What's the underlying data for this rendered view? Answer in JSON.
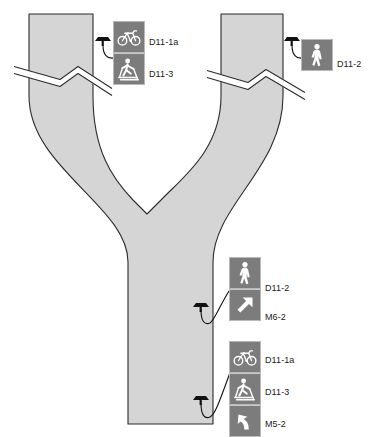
{
  "diagram": {
    "path_fill": "#d5d5d5",
    "path_stroke": "#2b2b2b",
    "sign_panel_color": "#7c7c7c",
    "sign_glyph_color": "#ffffff",
    "sign_border_color": "#b9b9b9",
    "label_color": "#1a1a1a",
    "background": "#ffffff"
  },
  "path_features": {
    "left_leg_label": "left-approach-leg",
    "right_leg_label": "right-approach-leg",
    "trunk_label": "main-path-trunk",
    "break_symbol_label": "path-break-symbol",
    "break_count": 2
  },
  "assemblies": [
    {
      "id": "top-left",
      "mount": "sign-post-base",
      "panels": [
        {
          "code": "D11-1a",
          "icon": "bicycle-icon",
          "meaning": "bike-route"
        },
        {
          "code": "D11-3",
          "icon": "skier-icon",
          "meaning": "cross-country-ski-route"
        }
      ]
    },
    {
      "id": "top-right",
      "mount": "sign-post-base",
      "panels": [
        {
          "code": "D11-2",
          "icon": "pedestrian-icon",
          "meaning": "walking-route"
        }
      ]
    },
    {
      "id": "mid-right",
      "mount": "sign-post-base",
      "panels": [
        {
          "code": "D11-2",
          "icon": "pedestrian-icon",
          "meaning": "walking-route"
        },
        {
          "code": "M6-2",
          "icon": "arrow-diagonal-icon",
          "meaning": "directional-arrow-ahead-right"
        }
      ]
    },
    {
      "id": "bottom-right",
      "mount": "sign-post-base",
      "panels": [
        {
          "code": "D11-1a",
          "icon": "bicycle-icon",
          "meaning": "bike-route"
        },
        {
          "code": "D11-3",
          "icon": "skier-icon",
          "meaning": "cross-country-ski-route"
        },
        {
          "code": "M5-2",
          "icon": "arrow-curved-icon",
          "meaning": "directional-arrow-turn-left"
        }
      ]
    }
  ],
  "labels": {
    "a0p0": "D11-1a",
    "a0p1": "D11-3",
    "a1p0": "D11-2",
    "a2p0": "D11-2",
    "a2p1": "M6-2",
    "a3p0": "D11-1a",
    "a3p1": "D11-3",
    "a3p2": "M5-2"
  }
}
